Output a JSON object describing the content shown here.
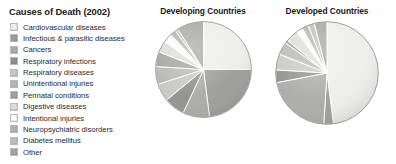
{
  "legend": {
    "title": "Causes of Death (2002)",
    "items": [
      {
        "label": "Cardiovascular diseases",
        "color": "#ededeb"
      },
      {
        "label": "Infectious & parasitic diseases",
        "color": "#9a9a98"
      },
      {
        "label": "Cancers",
        "color": "#a9a9a7"
      },
      {
        "label": "Respiratory infections",
        "color": "#8e8e8c"
      },
      {
        "label": "Respiratory diseases",
        "color": "#c6c6c3"
      },
      {
        "label": "Unintentional injuries",
        "color": "#b5b5b2"
      },
      {
        "label": "Perinatal conditions",
        "color": "#9f9f9d"
      },
      {
        "label": "Digestive diseases",
        "color": "#dcdcda"
      },
      {
        "label": "Intentional injuries",
        "color": "#fbfbfa"
      },
      {
        "label": "Neuropsychiatric disorders",
        "color": "#b0b0ad"
      },
      {
        "label": "Diabetes mellitus",
        "color": "#bdbdba"
      },
      {
        "label": "Other",
        "color": "#a3a3a1"
      }
    ]
  },
  "charts": {
    "developing": {
      "title": "Developing Countries"
    },
    "developed": {
      "title": "Developed Countries"
    }
  },
  "chart_data": [
    {
      "type": "pie",
      "title": "Developing Countries",
      "start_angle_deg": 0,
      "direction": "clockwise",
      "categories": [
        "Cardiovascular diseases",
        "Infectious & parasitic diseases",
        "Cancers",
        "Respiratory infections",
        "Respiratory diseases",
        "Unintentional injuries",
        "Perinatal conditions",
        "Digestive diseases",
        "Intentional injuries",
        "Neuropsychiatric disorders",
        "Diabetes mellitus",
        "Other"
      ],
      "values": [
        25,
        23,
        9,
        7,
        6,
        6,
        5,
        4,
        3,
        2,
        1,
        9
      ],
      "unit": "percent",
      "colors": [
        "#ededeb",
        "#9a9a98",
        "#a9a9a7",
        "#8e8e8c",
        "#c6c6c3",
        "#b5b5b2",
        "#9f9f9d",
        "#dcdcda",
        "#fbfbfa",
        "#b0b0ad",
        "#bdbdba",
        "#a3a3a1"
      ],
      "legend_position": "left",
      "grid": false
    },
    {
      "type": "pie",
      "title": "Developed Countries",
      "start_angle_deg": 0,
      "direction": "clockwise",
      "categories": [
        "Cardiovascular diseases",
        "Infectious & parasitic diseases",
        "Cancers",
        "Respiratory infections",
        "Respiratory diseases",
        "Unintentional injuries",
        "Perinatal conditions",
        "Digestive diseases",
        "Intentional injuries",
        "Neuropsychiatric disorders",
        "Diabetes mellitus",
        "Other"
      ],
      "values": [
        48,
        3,
        21,
        4,
        5,
        4,
        1,
        4,
        2,
        2,
        2,
        4
      ],
      "unit": "percent",
      "colors": [
        "#ededeb",
        "#9a9a98",
        "#a9a9a7",
        "#8e8e8c",
        "#c6c6c3",
        "#b5b5b2",
        "#9f9f9d",
        "#dcdcda",
        "#fbfbfa",
        "#b0b0ad",
        "#bdbdba",
        "#a3a3a1"
      ],
      "legend_position": "left",
      "grid": false
    }
  ]
}
